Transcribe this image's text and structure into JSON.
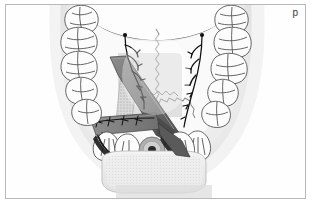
{
  "figure": {
    "panel_label": "p",
    "caption_absent": true,
    "orientation": "occlusal view of maxilla, anterior at bottom, posterior at top",
    "style": "grayscale medical line illustration with airbrushed shading"
  },
  "colors": {
    "background": "#ffffff",
    "frame_border": "#b9b9b9",
    "palate_light": "#f2f2f2",
    "palate_mid": "#e2e2e2",
    "palate_shadow": "#cfcfcf",
    "tooth_fill": "#fbfbfb",
    "tooth_outline": "#4a4a4a",
    "flap_dark": "#6d6d6d",
    "flap_darkest": "#4f4f4f",
    "graft_overlay": "#c8c8c8",
    "suture_black": "#1a1a1a",
    "nerve_black": "#111111",
    "bone_block": "#efefef",
    "implant_ring": "#b5b5b5",
    "implant_core": "#2a2a2a",
    "label_text": "#3a3a3a"
  },
  "anatomy": {
    "palate_label": "hard palate / palatal mucosa",
    "midline_suture_label": "palatal midline suture (zigzag incision line)",
    "flap_label": "rotated palatal connective tissue flap / pedicle graft",
    "donor_site_label": "palatal donor site (stippled)",
    "overlay_label": "graft outline overlay (translucent rectangle)",
    "nerve_left_label": "greater palatine neurovascular bundle (left)",
    "nerve_right_label": "greater palatine neurovascular bundle (right)",
    "suture_line_left_label": "interrupted sutures along left flap margin",
    "suture_line_anterior_label": "sutures across anterior ridge",
    "implant_label": "implant / root cross-section at anterior ridge",
    "bone_block_label": "anterior alveolar ridge block",
    "soft_palate_curve_label": "posterior soft palate border"
  },
  "teeth": {
    "left_arch_count": 7,
    "right_arch_count": 7,
    "anterior_count": 6,
    "left_labels": [
      "molar-3-left",
      "molar-2-left",
      "molar-1-left",
      "premolar-2-left",
      "premolar-1-left",
      "canine-left",
      "incisor-lateral-left"
    ],
    "right_labels": [
      "molar-3-right",
      "molar-2-right",
      "molar-1-right",
      "premolar-2-right",
      "premolar-1-right",
      "canine-right",
      "incisor-lateral-right"
    ],
    "anterior_labels": [
      "incisor-1",
      "incisor-2",
      "incisor-3",
      "incisor-4",
      "incisor-5",
      "incisor-6"
    ]
  }
}
